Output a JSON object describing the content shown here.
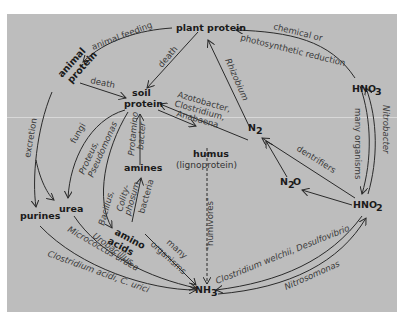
{
  "colors": {
    "background": "#bdbdbd",
    "ink": "#2a2a2a",
    "page": "#ffffff"
  },
  "nodes": {
    "plant_protein": "plant protein",
    "animal_protein_1": "animal",
    "animal_protein_2": "protein",
    "soil_protein_1": "soil",
    "soil_protein_2": "protein",
    "humus": "humus",
    "humus_sub": "(lignoprotein)",
    "amines": "amines",
    "amino_acids_1": "amino",
    "amino_acids_2": "acids",
    "urea": "urea",
    "purines": "purines",
    "nh3": "NH",
    "nh3_sub": "3",
    "n2": "N",
    "n2_sub": "2",
    "n2o_a": "N",
    "n2o_sub": "2",
    "n2o_b": "O",
    "hno3": "HNO",
    "hno3_sub": "3",
    "hno2": "HNO",
    "hno2_sub": "2"
  },
  "labels": {
    "animal_feeding": "animal feeding",
    "death_plant": "death",
    "death_animal": "death",
    "chemical_1": "chemical or",
    "chemical_2": "photosynthetic reduction",
    "rhizobium": "Rhizobium",
    "azotobacter_1": "Azotobacter,",
    "azotobacter_2": "Clostridium,",
    "azotobacter_3": "Anabaena",
    "excretion": "excretion",
    "fungi": "fungi",
    "proteus_1": "Proteus,",
    "proteus_2": "Pseudomonas",
    "protamino_1": "Protamino",
    "protamino_2": "bacter",
    "colity_1": "Colity-",
    "colity_2": "phosum",
    "colity_3": "bacteria",
    "bacillus": "Bacillus,",
    "many_org_1": "many",
    "many_org_2": "organisms",
    "humivores": "\"humivores\"",
    "urobacillus": "Urobacillus,",
    "micrococcus": "Micrococcus uraea",
    "clostridium_acidi": "Clostridium acidi, C. urici",
    "clostridium_welchii": "Clostridium welchii, Desulfovibrio",
    "nitrosomonas": "Nitrosomonas",
    "nitrobacter": "Nitrobacter",
    "many_organisms_hno": "many organisms",
    "dentrifiers": "dentrifiers"
  }
}
